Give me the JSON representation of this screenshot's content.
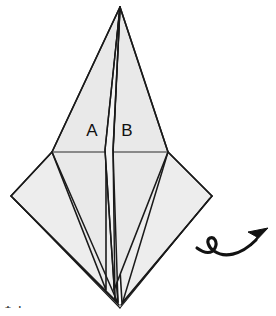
{
  "figure": {
    "kind": "origami-diagram",
    "background_color": "#ffffff",
    "paper_fill_color": "#e9e9e9",
    "paper_fill_color_light": "#ededed",
    "sliver_fill_color": "#f4f4f4",
    "line_color": "#1a1a1a",
    "crease_color": "#2b2b2b"
  },
  "labels": {
    "point_a": "A",
    "point_b": "B"
  },
  "symbols": {
    "turn_over_arrow": "turn-over-arrow",
    "turn_over_meaning": "turn model over"
  },
  "page_mark": {
    "text": "14",
    "visible_fragment": "cropped tops of two digits at bottom-left"
  },
  "geometry": {
    "apex": [
      120,
      7
    ],
    "bottom_point": [
      120,
      307
    ],
    "left_shoulder": [
      52,
      152
    ],
    "right_shoulder": [
      168,
      152
    ],
    "left_corner": [
      11,
      196
    ],
    "right_corner": [
      212,
      196
    ],
    "center_sliver_left_x": 106,
    "center_sliver_right_x": 113,
    "horizontal_crease_y": 152,
    "label_a_pos": [
      92,
      132
    ],
    "label_b_pos": [
      127,
      132
    ],
    "arrow_start": [
      197,
      248
    ],
    "arrow_loop_center": [
      219,
      243
    ],
    "arrow_tip": [
      268,
      229
    ]
  }
}
